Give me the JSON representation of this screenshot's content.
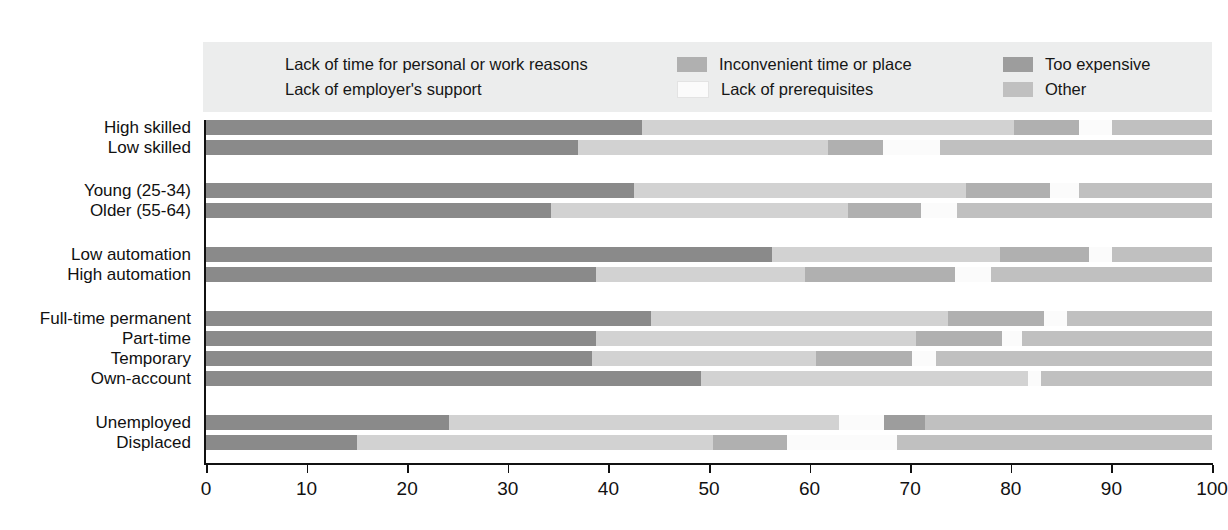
{
  "chart_data": {
    "type": "bar",
    "orientation": "horizontal",
    "stacked": true,
    "title": "",
    "xlabel": "",
    "ylabel": "",
    "xlim": [
      0,
      100
    ],
    "xticks": [
      0,
      10,
      20,
      30,
      40,
      50,
      60,
      70,
      80,
      90,
      100
    ],
    "xtick_labels": [
      "0",
      "10",
      "20",
      "30",
      "40",
      "50",
      "60",
      "70",
      "80",
      "90",
      "100"
    ],
    "grid": false,
    "legend_position": "top",
    "categories": [
      "High skilled",
      "Low skilled",
      "Young (25-34)",
      "Older (55-64)",
      "Low automation",
      "High automation",
      "Full-time permanent",
      "Part-time",
      "Temporary",
      "Own-account",
      "Unemployed",
      "Displaced"
    ],
    "series": [
      {
        "name": "Lack of time for personal or work reasons",
        "color": "#8a8a8a",
        "values": [
          43.3,
          37.0,
          42.5,
          34.3,
          56.3,
          38.8,
          44.2,
          38.8,
          38.4,
          49.2,
          24.2,
          15.0
        ]
      },
      {
        "name": "Lack of employer's support",
        "color": "#d2d2d2",
        "values": [
          37.0,
          24.8,
          33.0,
          29.5,
          22.6,
          20.7,
          29.6,
          31.8,
          22.2,
          32.5,
          38.7,
          35.4
        ]
      },
      {
        "name": "Inconvenient time or place",
        "color": "#b0b0b0",
        "values": [
          6.5,
          5.5,
          8.4,
          7.3,
          8.9,
          15.0,
          9.5,
          8.5,
          9.6,
          0.0,
          0.0,
          7.4
        ]
      },
      {
        "name": "Lack of prerequisites",
        "color": "#fbfbfb",
        "values": [
          3.3,
          5.7,
          2.9,
          3.6,
          2.3,
          3.5,
          2.3,
          2.0,
          2.4,
          1.3,
          4.5,
          10.9
        ]
      },
      {
        "name": "Too expensive",
        "color": "#9d9d9d",
        "values": [
          0.0,
          0.0,
          0.0,
          0.0,
          0.0,
          0.0,
          0.0,
          0.0,
          0.0,
          0.0,
          4.1,
          0.0
        ]
      },
      {
        "name": "Other",
        "color": "#c0c0c0",
        "values": [
          9.9,
          27.0,
          13.2,
          25.3,
          9.9,
          22.0,
          14.4,
          18.9,
          27.4,
          17.0,
          28.5,
          31.3
        ]
      }
    ],
    "legend_entries": [
      {
        "label": "Lack of time for personal or work reasons",
        "color": "#8a8a8a",
        "column": 1
      },
      {
        "label": "Lack of employer's support",
        "color": "#d2d2d2",
        "column": 1
      },
      {
        "label": "Inconvenient time or place",
        "color": "#b0b0b0",
        "column": 2
      },
      {
        "label": "Lack of prerequisites",
        "color": "#fbfbfb",
        "column": 2
      },
      {
        "label": "Too expensive",
        "color": "#9d9d9d",
        "column": 3
      },
      {
        "label": "Other",
        "color": "#c0c0c0",
        "column": 3
      }
    ],
    "row_layout": {
      "row_top": [
        0,
        20,
        63,
        83,
        127,
        147,
        191,
        211,
        231,
        251,
        295,
        315
      ],
      "bar_height": 15
    },
    "colors": {
      "legend_background": "#eceded",
      "axis": "#111111",
      "text": "#111111",
      "page_background": "#ffffff"
    }
  }
}
